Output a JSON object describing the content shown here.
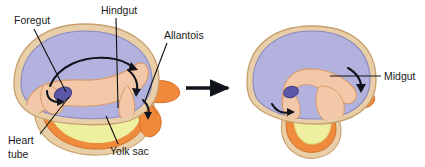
{
  "figure": {
    "panels": [
      {
        "id": "panel-left",
        "name": "early-embryo-stage"
      },
      {
        "id": "panel-right",
        "name": "later-embryo-stage"
      }
    ]
  },
  "labels": {
    "foregut": "Foregut",
    "hindgut": "Hindgut",
    "allantois": "Allantois",
    "heart_tube": "Heart",
    "heart_tube2": "tube",
    "yolk_sac": "Yolk sac",
    "midgut": "Midgut"
  },
  "colors": {
    "amnion_fill": "#e8cfa8",
    "amnion_edge": "#c79f6e",
    "embryo_fill": "#b3b2de",
    "embryo_edge": "#8a88c0",
    "gut_fill": "#f2c8a8",
    "gut_edge": "#d79a6b",
    "heart_fill": "#5b58a8",
    "heart_edge": "#3f3d82",
    "yolk_fill": "#eef0a0",
    "yolk_edge": "#ef8b3c",
    "allantois_fill": "#f08a3a",
    "allantois_edge": "#d4702a",
    "arrow": "#11131c",
    "text": "#1a1a1a",
    "background": "#ffffff"
  },
  "transition_arrow": {
    "name": "stage-transition-arrow",
    "direction": "right"
  },
  "rotation_arrows": {
    "count_left": 4,
    "count_right": 2,
    "meaning": "direction of gut tube rotation / folding"
  }
}
